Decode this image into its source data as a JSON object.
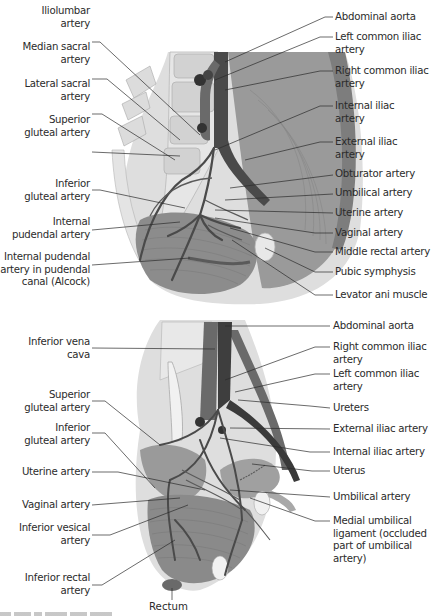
{
  "figure": {
    "type": "anatomical-illustration",
    "colors": {
      "artery": "#4a4a4a",
      "vein": "#6e6e6e",
      "muscle": "#8f8f8f",
      "bone": "#e2e2e2",
      "soft_tissue": "#d0d0d0",
      "leader_line": "#2b2b2b",
      "background": "#ffffff"
    },
    "top_panel": {
      "left_labels": [
        {
          "line1": "Iliolumbar",
          "line2": "artery"
        },
        {
          "line1": "Median sacral",
          "line2": "artery"
        },
        {
          "line1": "Lateral sacral",
          "line2": "artery"
        },
        {
          "line1": "Superior",
          "line2": "gluteal artery"
        },
        {
          "line1": "Inferior",
          "line2": "gluteal artery"
        },
        {
          "line1": "Internal",
          "line2": "pudendal artery"
        },
        {
          "line1": "Internal pudendal",
          "line2": "artery in pudendal",
          "line3": "canal (Alcock)"
        }
      ],
      "right_labels": [
        {
          "line1": "Abdominal aorta"
        },
        {
          "line1": "Left common iliac",
          "line2": "artery"
        },
        {
          "line1": "Right common iliac",
          "line2": "artery"
        },
        {
          "line1": "Internal iliac",
          "line2": "artery"
        },
        {
          "line1": "External iliac",
          "line2": "artery"
        },
        {
          "line1": "Obturator artery"
        },
        {
          "line1": "Umbilical artery"
        },
        {
          "line1": "Uterine artery"
        },
        {
          "line1": "Vaginal artery"
        },
        {
          "line1": "Middle rectal artery"
        },
        {
          "line1": "Pubic symphysis"
        },
        {
          "line1": "Levator ani muscle"
        }
      ]
    },
    "bottom_panel": {
      "left_labels": [
        {
          "line1": "Inferior vena",
          "line2": "cava"
        },
        {
          "line1": "Superior",
          "line2": "gluteal artery"
        },
        {
          "line1": "Inferior",
          "line2": "gluteal artery"
        },
        {
          "line1": "Uterine artery"
        },
        {
          "line1": "Vaginal artery"
        },
        {
          "line1": "Inferior vesical",
          "line2": "artery"
        },
        {
          "line1": "Inferior rectal",
          "line2": "artery"
        }
      ],
      "right_labels": [
        {
          "line1": "Abdominal aorta"
        },
        {
          "line1": "Right common iliac",
          "line2": "artery"
        },
        {
          "line1": "Left common iliac",
          "line2": "artery"
        },
        {
          "line1": "Ureters"
        },
        {
          "line1": "External iliac artery"
        },
        {
          "line1": "Internal iliac artery"
        },
        {
          "line1": "Uterus"
        },
        {
          "line1": "Umbilical artery"
        },
        {
          "line1": "Medial umbilical",
          "line2": "ligament (occluded",
          "line3": "part of umbilical",
          "line4": "artery)"
        }
      ],
      "bottom_label": "Rectum"
    }
  }
}
